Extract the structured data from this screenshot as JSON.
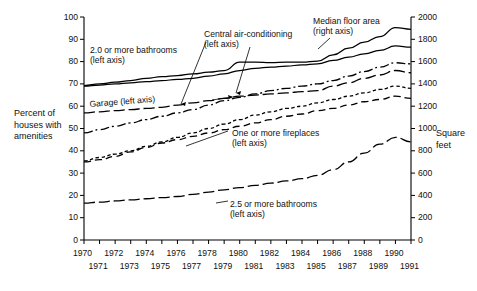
{
  "chart_data": {
    "type": "line",
    "title": "",
    "xlabel": "",
    "ylabel": "Percent of houses with amenities",
    "ylabel_right": "Square feet",
    "xlim": [
      1970,
      1991
    ],
    "ylim": [
      0,
      100
    ],
    "ylim_right": [
      0,
      2000
    ],
    "grid": false,
    "legend_position": "inline-annotations",
    "x": [
      1970,
      1971,
      1972,
      1973,
      1974,
      1975,
      1976,
      1977,
      1978,
      1979,
      1980,
      1981,
      1982,
      1983,
      1984,
      1985,
      1986,
      1987,
      1988,
      1989,
      1990,
      1991
    ],
    "xticklabels_upper": [
      "1970",
      "1972",
      "1974",
      "1976",
      "1978",
      "1980",
      "1982",
      "1984",
      "1986",
      "1988",
      "1990"
    ],
    "xticklabels_lower": [
      "1971",
      "1973",
      "1975",
      "1977",
      "1979",
      "1981",
      "1983",
      "1985",
      "1987",
      "1989",
      "1991"
    ],
    "yticklabels_left": [
      "0",
      "10",
      "20",
      "30",
      "40",
      "50",
      "60",
      "70",
      "80",
      "90",
      "100"
    ],
    "yticklabels_right": [
      "0",
      "200",
      "400",
      "600",
      "800",
      "1000",
      "1200",
      "1400",
      "1600",
      "1800",
      "2000"
    ],
    "series": [
      {
        "name": "Median floor area (right axis)",
        "axis": "right",
        "style": "solid",
        "units": "square feet",
        "values": [
          1385,
          1400,
          1415,
          1430,
          1450,
          1465,
          1475,
          1490,
          1505,
          1520,
          1595,
          1595,
          1590,
          1595,
          1595,
          1605,
          1660,
          1720,
          1775,
          1825,
          1905,
          1890
        ]
      },
      {
        "name": "2.0 or more bathrooms (left axis)",
        "axis": "left",
        "style": "solid",
        "units": "percent",
        "values": [
          69,
          69.5,
          70,
          70.5,
          71,
          71.5,
          72,
          72.5,
          73.5,
          74.5,
          76,
          77,
          77.5,
          78,
          78.5,
          79,
          80.5,
          82,
          83.5,
          85,
          87,
          86.5
        ]
      },
      {
        "name": "Central air-conditioning (left axis)",
        "axis": "left",
        "style": "dash-dot",
        "units": "percent",
        "values": [
          48,
          49.5,
          51,
          52.5,
          54,
          55.5,
          57,
          58.5,
          60.5,
          62.5,
          64,
          65.5,
          67,
          68,
          69,
          70,
          71.5,
          73.5,
          75.5,
          77.5,
          79.5,
          79
        ]
      },
      {
        "name": "Garage (left axis)",
        "axis": "left",
        "style": "long-dash",
        "units": "percent",
        "values": [
          57,
          57.5,
          58,
          58.5,
          59,
          59.5,
          60.5,
          61.5,
          62.5,
          63.5,
          64.5,
          65,
          65.5,
          66,
          66.5,
          67,
          69,
          70.5,
          72.5,
          74,
          76,
          75
        ]
      },
      {
        "name": "One or more fireplaces (left axis)",
        "axis": "left",
        "style": "short-dash",
        "units": "percent",
        "values": [
          35.5,
          37,
          38.5,
          40,
          42,
          44,
          46,
          48,
          50,
          52,
          54,
          56,
          57.5,
          59,
          60,
          61.5,
          63,
          64.5,
          66,
          67.5,
          69,
          68
        ]
      },
      {
        "name": "2.5 or more bathrooms (left axis)",
        "axis": "left",
        "style": "medium-dash",
        "units": "percent",
        "values": [
          35,
          36,
          37.5,
          39.5,
          41.5,
          43.5,
          45,
          46.5,
          48,
          49.5,
          51,
          52.5,
          54,
          55.5,
          56.5,
          58,
          59,
          60.5,
          62,
          63,
          64.5,
          63.5
        ]
      },
      {
        "name": "Lower trailing series (left axis)",
        "axis": "left",
        "style": "long-dash",
        "units": "percent",
        "values": [
          16.5,
          17,
          17.5,
          18,
          18.5,
          19,
          19.5,
          20.5,
          21.5,
          22.5,
          23.5,
          24.5,
          25.5,
          26.5,
          27.5,
          29,
          31.5,
          35,
          39,
          43,
          46,
          44
        ]
      }
    ],
    "annotations": [
      {
        "id": "ann-two-bathrooms",
        "text_line1": "2.0 or more bathrooms",
        "text_line2": "(left axis)"
      },
      {
        "id": "ann-central-air",
        "text_line1": "Central air-conditioning",
        "text_line2": "(left axis)"
      },
      {
        "id": "ann-median-floor",
        "text_line1": "Median floor area",
        "text_line2": "(right axis)"
      },
      {
        "id": "ann-garage",
        "text_line1": "Garage (left axis)",
        "text_line2": ""
      },
      {
        "id": "ann-fireplaces",
        "text_line1": "One or more fireplaces",
        "text_line2": "(left axis)"
      },
      {
        "id": "ann-two-five-bathrooms",
        "text_line1": "2.5 or more bathrooms",
        "text_line2": "(left axis)"
      }
    ],
    "axis_titles": {
      "left_line1": "Percent of",
      "left_line2": "houses with",
      "left_line3": "amenities",
      "right_line1": "Square",
      "right_line2": "feet"
    },
    "colors": {
      "line": "#000000",
      "text": "#111111",
      "axis": "#000000",
      "background": "#ffffff"
    }
  }
}
